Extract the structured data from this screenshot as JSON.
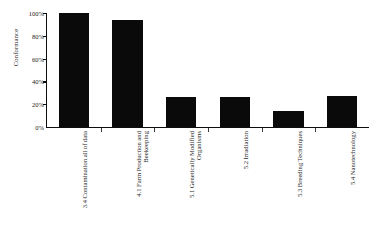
{
  "chart_data": {
    "type": "bar",
    "title": "",
    "xlabel": "",
    "ylabel": "Conformance",
    "ylim": [
      0,
      100
    ],
    "grid": false,
    "legend": null,
    "categories": [
      "3.4 Contamination all of data",
      "4.1 Farm Production and Beekeeping",
      "5.1 Genetically Modified Organisms",
      "5.2 Irradiation",
      "5.3 Breeding Techniques",
      "5.4 Nanotechnology"
    ],
    "values": [
      100,
      94,
      26,
      26,
      14,
      27
    ],
    "value_labels": [
      "100%",
      "94%",
      "26%",
      "26%",
      "14%",
      "27%"
    ],
    "ytick_labels": [
      "100%",
      "80%",
      "60%",
      "40%",
      "20%",
      "0%"
    ],
    "ytick_values": [
      100,
      80,
      60,
      40,
      20,
      0
    ],
    "bar_color": "#0a0a0a",
    "axis_color": "#0d0d0d"
  }
}
